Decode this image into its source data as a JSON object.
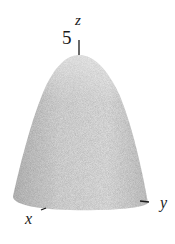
{
  "figure": {
    "surface_color": "#c8c8c8",
    "axis_color": "#1a1a1a",
    "labels": {
      "z_axis": "z",
      "x_axis": "x",
      "y_axis": "y",
      "z_intercept": "5"
    }
  }
}
